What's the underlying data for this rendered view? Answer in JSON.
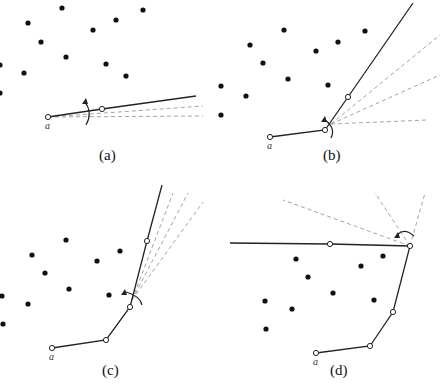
{
  "figure": {
    "panels": [
      {
        "id": "a",
        "caption": "(a)",
        "caption_pos": [
          99,
          160
        ],
        "start_label": "a",
        "start_label_pos": [
          45,
          129
        ],
        "points": [
          [
            62,
            8
          ],
          [
            28,
            23
          ],
          [
            116,
            20
          ],
          [
            143,
            10
          ],
          [
            93,
            30
          ],
          [
            41,
            42
          ],
          [
            66,
            57
          ],
          [
            106,
            64
          ],
          [
            126,
            76
          ],
          [
            24,
            73
          ],
          [
            0,
            65
          ],
          [
            0,
            93
          ]
        ],
        "path": [
          [
            48,
            117
          ],
          [
            102,
            109
          ],
          [
            196,
            96
          ]
        ],
        "hinge": [
          48,
          117
        ],
        "dashed": [
          [
            [
              48,
              117
            ],
            [
              203,
              106
            ]
          ],
          [
            [
              48,
              117
            ],
            [
              203,
              116
            ]
          ]
        ],
        "arc": {
          "d": "M 85 102 Q 93 113 86 125",
          "arrow": [
            85,
            101
          ]
        }
      },
      {
        "id": "b",
        "caption": "(b)",
        "caption_pos": [
          323,
          160
        ],
        "start_label": "a",
        "start_label_pos": [
          267,
          149
        ],
        "points": [
          [
            284,
            30
          ],
          [
            250,
            45
          ],
          [
            263,
            63
          ],
          [
            316,
            51
          ],
          [
            338,
            42
          ],
          [
            365,
            31
          ],
          [
            288,
            79
          ],
          [
            328,
            85
          ],
          [
            246,
            96
          ],
          [
            221,
            86
          ],
          [
            221,
            115
          ]
        ],
        "path": [
          [
            270,
            137
          ],
          [
            325,
            130
          ],
          [
            348,
            97
          ],
          [
            413,
            3
          ]
        ],
        "hinge": [
          331,
          124
        ],
        "dashed": [
          [
            [
              331,
              124
            ],
            [
              440,
              35
            ]
          ],
          [
            [
              331,
              124
            ],
            [
              440,
              75
            ]
          ],
          [
            [
              331,
              124
            ],
            [
              427,
              120
            ]
          ]
        ],
        "arc": {
          "d": "M 325 120 Q 336 128 331 138",
          "arrow": [
            324,
            119
          ]
        }
      },
      {
        "id": "c",
        "caption": "(c)",
        "caption_pos": [
          102,
          375
        ],
        "start_label": "a",
        "start_label_pos": [
          49,
          360
        ],
        "points": [
          [
            66,
            240
          ],
          [
            32,
            255
          ],
          [
            45,
            273
          ],
          [
            97,
            261
          ],
          [
            120,
            251
          ],
          [
            69,
            289
          ],
          [
            109,
            295
          ],
          [
            28,
            304
          ],
          [
            2,
            296
          ],
          [
            3,
            324
          ]
        ],
        "path": [
          [
            52,
            348
          ],
          [
            106,
            340
          ],
          [
            130,
            307
          ],
          [
            147,
            241
          ],
          [
            162,
            185
          ]
        ],
        "hinge": [
          132,
          300
        ],
        "dashed": [
          [
            [
              132,
              300
            ],
            [
              173,
              193
            ]
          ],
          [
            [
              132,
              300
            ],
            [
              188,
              193
            ]
          ],
          [
            [
              132,
              300
            ],
            [
              203,
              202
            ]
          ]
        ],
        "arc": {
          "d": "M 126 292 Q 140 296 142 305",
          "arrow": [
            124,
            292
          ]
        }
      },
      {
        "id": "d",
        "caption": "(d)",
        "caption_pos": [
          330,
          375
        ],
        "start_label": "a",
        "start_label_pos": [
          313,
          365
        ],
        "points": [
          [
            296,
            259
          ],
          [
            308,
            277
          ],
          [
            361,
            266
          ],
          [
            383,
            256
          ],
          [
            333,
            293
          ],
          [
            265,
            301
          ],
          [
            292,
            309
          ],
          [
            374,
            300
          ],
          [
            266,
            329
          ]
        ],
        "path": [
          [
            316,
            353
          ],
          [
            370,
            346
          ],
          [
            393,
            312
          ],
          [
            410,
            246
          ],
          [
            330,
            244
          ],
          [
            230,
            243
          ]
        ],
        "hinge": [
          410,
          246
        ],
        "dashed": [
          [
            [
              410,
              246
            ],
            [
              283,
              200
            ]
          ],
          [
            [
              410,
              246
            ],
            [
              375,
              193
            ]
          ],
          [
            [
              410,
              246
            ],
            [
              425,
              193
            ]
          ]
        ],
        "arc": {
          "d": "M 414 236 Q 405 228 398 234",
          "arrow": [
            397,
            235
          ]
        }
      }
    ]
  }
}
